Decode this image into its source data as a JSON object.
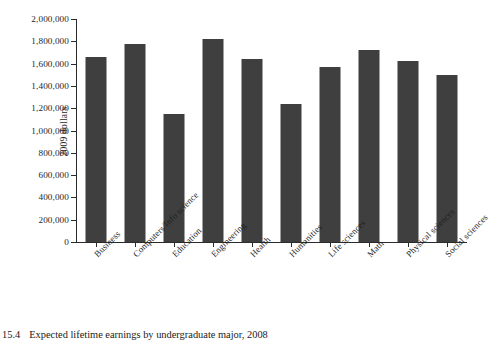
{
  "chart_data": {
    "type": "bar",
    "title": "",
    "xlabel": "",
    "ylabel": "2009 dollars",
    "ylim": [
      0,
      2000000
    ],
    "grid": false,
    "legend": null,
    "bar_color": "#3f3f3f",
    "categories": [
      "Business",
      "Computers/Info science",
      "Education",
      "Engineering",
      "Health",
      "Humanities",
      "Life sciences",
      "Math",
      "Physical sciences",
      "Social sciences"
    ],
    "values": [
      1660000,
      1780000,
      1150000,
      1820000,
      1640000,
      1240000,
      1570000,
      1720000,
      1620000,
      1500000
    ],
    "ytick_values": [
      0,
      200000,
      400000,
      600000,
      800000,
      1000000,
      1200000,
      1400000,
      1600000,
      1800000,
      2000000
    ],
    "ytick_labels": [
      "0",
      "200,000",
      "400,000",
      "600,000",
      "800,000",
      "1,000,000",
      "1,200,000",
      "1,400,000",
      "1,600,000",
      "1,800,000",
      "2,000,000"
    ]
  },
  "caption": {
    "number": "15.4",
    "text": "Expected lifetime earnings by undergraduate major, 2008"
  }
}
